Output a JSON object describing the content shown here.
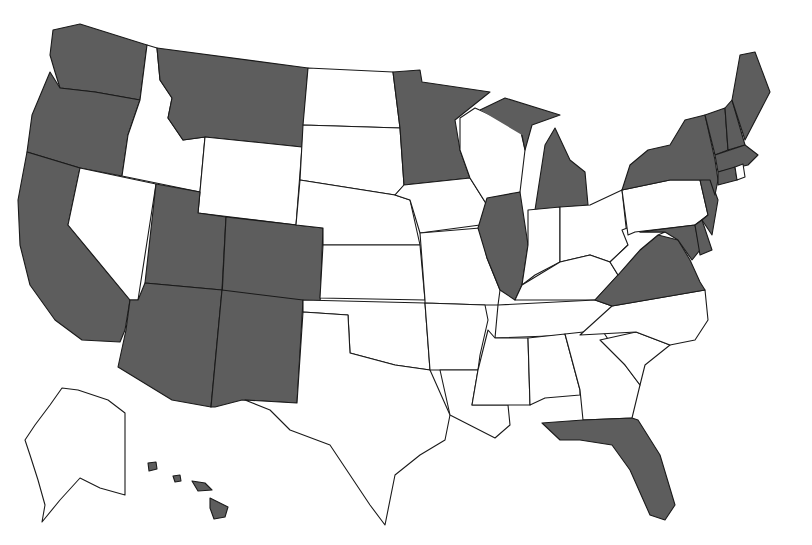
{
  "map": {
    "title": "",
    "type": "choropleth",
    "region": "United States",
    "legend": [],
    "colors": {
      "shaded": "#5d5d5d",
      "unshaded": "#ffffff",
      "border": "#1a1a1a"
    },
    "shaded_states": [
      "WA",
      "OR",
      "CA",
      "MT",
      "UT",
      "CO",
      "AZ",
      "NM",
      "MN",
      "IL",
      "MI",
      "NY",
      "VT",
      "NH",
      "ME",
      "MA",
      "CT",
      "NJ",
      "DE",
      "MD",
      "VA",
      "FL",
      "HI"
    ],
    "unshaded_states": [
      "ID",
      "NV",
      "WY",
      "ND",
      "SD",
      "NE",
      "KS",
      "OK",
      "TX",
      "IA",
      "MO",
      "AR",
      "LA",
      "WI",
      "IN",
      "OH",
      "KY",
      "TN",
      "MS",
      "AL",
      "GA",
      "SC",
      "NC",
      "WV",
      "PA",
      "RI",
      "AK"
    ]
  }
}
